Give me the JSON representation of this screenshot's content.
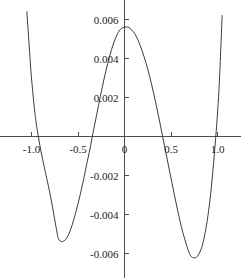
{
  "chart_data": {
    "type": "line",
    "title": "",
    "subtitle": "",
    "xlabel": "",
    "ylabel": "",
    "xlim": [
      -1.05,
      1.05
    ],
    "ylim": [
      -0.0065,
      0.0065
    ],
    "grid": false,
    "legend": null,
    "legend_position": "none",
    "axis_style": "centered-cross",
    "x_ticks": [
      {
        "value": -1.0,
        "label": "-1.0"
      },
      {
        "value": -0.5,
        "label": "-0.5"
      },
      {
        "value": 0.0,
        "label": "0"
      },
      {
        "value": 0.5,
        "label": "0.5"
      },
      {
        "value": 1.0,
        "label": "1.0"
      }
    ],
    "y_ticks": [
      {
        "value": 0.006,
        "label": "0.006"
      },
      {
        "value": 0.004,
        "label": "0.004"
      },
      {
        "value": 0.002,
        "label": "0.002"
      },
      {
        "value": -0.002,
        "label": "-0.002"
      },
      {
        "value": -0.004,
        "label": "-0.004"
      },
      {
        "value": -0.006,
        "label": "-0.006"
      }
    ],
    "series": [
      {
        "name": "curve",
        "color": "#3c3c3c",
        "x": [
          -1.05,
          -1.02,
          -1.0,
          -0.97,
          -0.95,
          -0.93,
          -0.91,
          -0.89,
          -0.87,
          -0.85,
          -0.82,
          -0.79,
          -0.76,
          -0.73,
          -0.71,
          -0.68,
          -0.65,
          -0.62,
          -0.59,
          -0.56,
          -0.53,
          -0.5,
          -0.47,
          -0.44,
          -0.41,
          -0.37,
          -0.34,
          -0.3,
          -0.26,
          -0.22,
          -0.18,
          -0.14,
          -0.1,
          -0.06,
          -0.02,
          0.02,
          0.05,
          0.09,
          0.13,
          0.17,
          0.21,
          0.25,
          0.29,
          0.33,
          0.37,
          0.41,
          0.45,
          0.49,
          0.53,
          0.57,
          0.61,
          0.65,
          0.69,
          0.72,
          0.76,
          0.79,
          0.83,
          0.86,
          0.89,
          0.92,
          0.95,
          0.98,
          1.0,
          1.02,
          1.05
        ],
        "y": [
          0.0064,
          0.0043,
          0.003,
          0.0015,
          0.0007,
          0.0001,
          -0.00045,
          -0.00095,
          -0.0014,
          -0.00185,
          -0.0025,
          -0.0032,
          -0.004,
          -0.0048,
          -0.00525,
          -0.00538,
          -0.00535,
          -0.0052,
          -0.0049,
          -0.0045,
          -0.004,
          -0.00345,
          -0.00285,
          -0.0022,
          -0.0015,
          -0.0006,
          0.00015,
          0.0011,
          0.00205,
          0.00295,
          0.00375,
          0.00445,
          0.005,
          0.0054,
          0.00558,
          0.00562,
          0.00558,
          0.0054,
          0.0051,
          0.00465,
          0.0041,
          0.00345,
          0.0027,
          0.00185,
          0.00095,
          0.0,
          -0.00095,
          -0.0019,
          -0.00285,
          -0.00375,
          -0.0046,
          -0.0053,
          -0.0059,
          -0.00617,
          -0.00622,
          -0.0061,
          -0.0057,
          -0.0051,
          -0.0043,
          -0.0032,
          -0.0018,
          -0.0001,
          0.0012,
          0.0028,
          0.0062
        ],
        "key_points": {
          "maximum": {
            "x": 0.03,
            "y": 0.00562
          },
          "left_minimum": {
            "x": -0.68,
            "y": -0.00538
          },
          "right_minimum": {
            "x": 0.76,
            "y": -0.00622
          },
          "zero_crossings": [
            -0.93,
            -0.35,
            0.41,
            0.98
          ]
        }
      }
    ]
  },
  "colors": {
    "curve": "#3c3c3c",
    "axis": "#4d4d4d",
    "text": "#1a1a1a",
    "background": "#ffffff"
  }
}
